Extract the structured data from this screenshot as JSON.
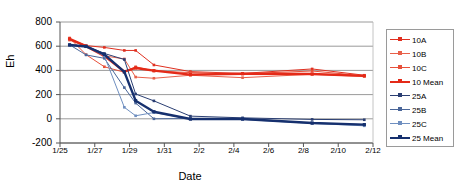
{
  "chart_data": {
    "type": "line",
    "title": "",
    "xlabel": "Date",
    "ylabel": "Eh",
    "xlim": [
      0,
      18
    ],
    "ylim": [
      -200,
      800
    ],
    "ytick_labels": [
      "800",
      "600",
      "400",
      "200",
      "0",
      "-200"
    ],
    "ytick_values": [
      800,
      600,
      400,
      200,
      0,
      -200
    ],
    "xtick_labels": [
      "1/25",
      "1/27",
      "1/29",
      "1/31",
      "2/2",
      "2/4",
      "2/6",
      "2/8",
      "2/10",
      "2/12"
    ],
    "xtick_values": [
      0,
      2,
      4,
      6,
      8,
      10,
      12,
      14,
      16,
      18
    ],
    "grid": "horizontal",
    "legend_position": "right",
    "x": [
      0.55,
      1.5,
      2.55,
      3.7,
      4.35,
      5.4,
      7.5,
      10.5,
      14.5,
      17.5
    ],
    "series": [
      {
        "name": "10A",
        "color": "#E03020",
        "width": 1,
        "marker": "square",
        "values": [
          660,
          605,
          590,
          565,
          565,
          445,
          390,
          375,
          412,
          360
        ]
      },
      {
        "name": "10B",
        "color": "#E8604A",
        "width": 1,
        "marker": "square",
        "values": [
          650,
          600,
          520,
          495,
          345,
          335,
          360,
          340,
          368,
          350
        ]
      },
      {
        "name": "10C",
        "color": "#E8503A",
        "width": 1,
        "marker": "square",
        "values": [
          668,
          530,
          430,
          385,
          430,
          395,
          382,
          372,
          395,
          355
        ]
      },
      {
        "name": "10 Mean",
        "color": "#E42A18",
        "width": 2.4,
        "marker": "square",
        "values": [
          660,
          600,
          520,
          390,
          420,
          398,
          365,
          372,
          370,
          355
        ]
      },
      {
        "name": "25A",
        "color": "#2B3F73",
        "width": 1,
        "marker": "square",
        "values": [
          612,
          600,
          540,
          490,
          205,
          148,
          22,
          8,
          -5,
          -8
        ]
      },
      {
        "name": "25B",
        "color": "#4A6699",
        "width": 1,
        "marker": "square",
        "values": [
          612,
          528,
          500,
          258,
          130,
          0,
          2,
          2,
          -35,
          -48
        ]
      },
      {
        "name": "25C",
        "color": "#6F8FC0",
        "width": 1,
        "marker": "square",
        "values": [
          608,
          600,
          520,
          95,
          25,
          52,
          -2,
          -5,
          -38,
          -58
        ]
      },
      {
        "name": "25 Mean",
        "color": "#16306E",
        "width": 2.4,
        "marker": "square",
        "values": [
          610,
          598,
          532,
          388,
          150,
          58,
          -2,
          -2,
          -35,
          -48
        ]
      }
    ],
    "legend": [
      {
        "label": "10A",
        "color": "#E03020",
        "thick": false
      },
      {
        "label": "10B",
        "color": "#E8604A",
        "thick": false
      },
      {
        "label": "10C",
        "color": "#E8503A",
        "thick": false
      },
      {
        "label": "10 Mean",
        "color": "#E42A18",
        "thick": true
      },
      {
        "label": "25A",
        "color": "#2B3F73",
        "thick": false
      },
      {
        "label": "25B",
        "color": "#4A6699",
        "thick": false
      },
      {
        "label": "25C",
        "color": "#6F8FC0",
        "thick": false
      },
      {
        "label": "25 Mean",
        "color": "#16306E",
        "thick": true
      }
    ]
  }
}
